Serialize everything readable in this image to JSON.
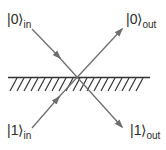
{
  "diagram": {
    "type": "beam-splitter",
    "line_color": "#6e6e6e",
    "surface_color": "#333333",
    "labels": {
      "in0": {
        "ket": "|0⟩",
        "sub": "in"
      },
      "out0": {
        "ket": "|0⟩",
        "sub": "out"
      },
      "in1": {
        "ket": "|1⟩",
        "sub": "in"
      },
      "out1": {
        "ket": "|1⟩",
        "sub": "out"
      }
    },
    "beams": [
      {
        "from": "in0",
        "to": "out1"
      },
      {
        "from": "in1",
        "to": "out0"
      }
    ]
  }
}
